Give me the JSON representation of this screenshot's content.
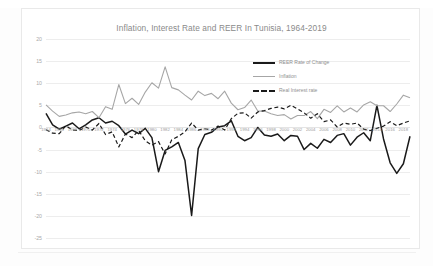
{
  "chart_data": {
    "type": "line",
    "title": "Inflation, Interest Rate and REER In Tunisia, 1964-2019",
    "xlabel": "",
    "ylabel": "",
    "ylim": [
      -25,
      20
    ],
    "ytick_step": 5,
    "yticks": [
      "20",
      "15",
      "10",
      "5",
      "0",
      "-5",
      "-10",
      "-15",
      "-20",
      "-25"
    ],
    "grid": true,
    "legend_position": "top-right",
    "xlim": [
      1964,
      2019
    ],
    "xtick_step": 2,
    "xticks": [
      "1964",
      "1966",
      "1968",
      "1970",
      "1972",
      "1974",
      "1976",
      "1978",
      "1980",
      "1982",
      "1984",
      "1986",
      "1988",
      "1990",
      "1992",
      "1994",
      "1996",
      "1998",
      "2000",
      "2002",
      "2004",
      "2006",
      "2008",
      "2010",
      "2012",
      "2014",
      "2016",
      "2018"
    ],
    "x": [
      1964,
      1965,
      1966,
      1967,
      1968,
      1969,
      1970,
      1971,
      1972,
      1973,
      1974,
      1975,
      1976,
      1977,
      1978,
      1979,
      1980,
      1981,
      1982,
      1983,
      1984,
      1985,
      1986,
      1987,
      1988,
      1989,
      1990,
      1991,
      1992,
      1993,
      1994,
      1995,
      1996,
      1997,
      1998,
      1999,
      2000,
      2001,
      2002,
      2003,
      2004,
      2005,
      2006,
      2007,
      2008,
      2009,
      2010,
      2011,
      2012,
      2013,
      2014,
      2015,
      2016,
      2017,
      2018,
      2019
    ],
    "series": [
      {
        "name": "REER Rate of Change",
        "color": "#1a1a1a",
        "style": "solid",
        "width": 1.5,
        "values": [
          3.2,
          0.6,
          -0.4,
          0.3,
          1.0,
          -0.3,
          0.6,
          1.7,
          2.2,
          1.0,
          1.4,
          0.4,
          -1.5,
          -0.6,
          -1.4,
          -0.2,
          -2.3,
          -10.0,
          -5.2,
          -4.4,
          -3.4,
          -7.5,
          -19.9,
          -4.8,
          -1.6,
          -1.1,
          0.1,
          0.4,
          1.5,
          -2.0,
          -3.0,
          -2.3,
          0.0,
          -1.7,
          -2.0,
          -1.5,
          -3.0,
          -1.8,
          -2.0,
          -5.0,
          -3.6,
          -4.7,
          -2.7,
          -3.4,
          -1.8,
          -1.4,
          -4.0,
          -2.2,
          -1.2,
          -3.0,
          5.0,
          -2.6,
          -8.0,
          -10.4,
          -8.2,
          -2.0
        ]
      },
      {
        "name": "Inflation",
        "color": "#a6a6a6",
        "style": "solid",
        "width": 1.1,
        "values": [
          5.1,
          3.7,
          2.5,
          2.8,
          3.3,
          3.5,
          3.1,
          3.6,
          2.2,
          4.7,
          4.1,
          9.7,
          5.4,
          6.6,
          5.2,
          8.0,
          10.1,
          8.9,
          13.7,
          9.0,
          8.5,
          7.3,
          6.2,
          8.2,
          7.2,
          7.7,
          6.5,
          8.2,
          5.5,
          4.0,
          4.5,
          6.2,
          3.7,
          3.7,
          3.1,
          2.7,
          2.9,
          1.9,
          2.7,
          2.7,
          3.6,
          2.0,
          4.1,
          3.4,
          4.9,
          3.5,
          4.4,
          3.5,
          5.1,
          5.8,
          4.9,
          4.9,
          3.6,
          5.3,
          7.3,
          6.7
        ]
      },
      {
        "name": "Real Interest rate",
        "color": "#1a1a1a",
        "style": "dashed",
        "width": 1.2,
        "values": [
          -0.5,
          -1.3,
          -1.4,
          0.4,
          -0.6,
          -0.7,
          0.1,
          -0.6,
          0.9,
          -1.6,
          -1.0,
          -4.4,
          -1.5,
          -2.3,
          -0.7,
          -3.0,
          -4.0,
          -3.2,
          -6.0,
          -2.8,
          -2.0,
          -1.0,
          1.0,
          -0.6,
          -0.3,
          -0.6,
          0.3,
          -0.6,
          2.0,
          3.2,
          3.3,
          2.1,
          3.5,
          3.8,
          4.3,
          4.6,
          4.2,
          5.0,
          4.2,
          3.3,
          2.1,
          3.1,
          1.3,
          1.7,
          0.1,
          1.0,
          0.7,
          1.0,
          -0.4,
          -0.7,
          -0.2,
          0.3,
          1.3,
          0.4,
          1.0,
          1.5
        ]
      }
    ]
  },
  "legend": {
    "items": [
      {
        "label": "REER Rate of Change"
      },
      {
        "label": "Inflation"
      },
      {
        "label": "Real Interest rate"
      }
    ]
  }
}
